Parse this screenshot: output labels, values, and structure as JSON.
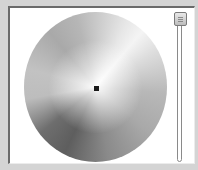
{
  "color_picker": {
    "type": "grayscale-wheel",
    "selected_point": {
      "x": 96,
      "y": 88
    },
    "accent_colors": {
      "panel_background": "#ffffff",
      "window_background": "#d4d4d4",
      "marker": "#1a1a1a"
    }
  },
  "brightness_slider": {
    "orientation": "vertical",
    "position_percent": 100
  }
}
